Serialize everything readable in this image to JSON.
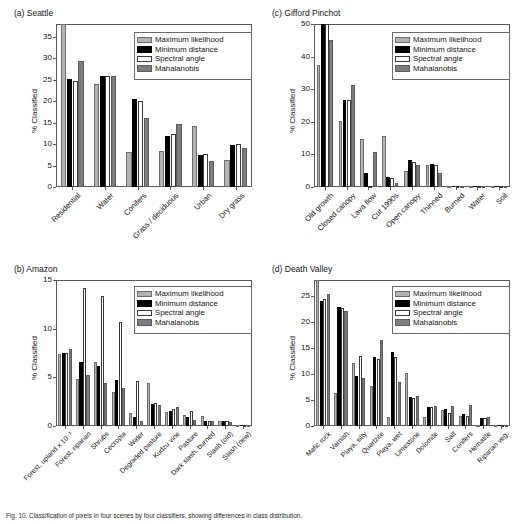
{
  "figure": {
    "caption": "Fig. 10. Classification of pixels in four scenes by four classifiers, showing differences in class distribution."
  },
  "legend": {
    "entries": [
      {
        "label": "Maximum likelihood",
        "key": "ml",
        "color": "#b3b3b3"
      },
      {
        "label": "Minimum distance",
        "key": "md",
        "color": "#000000"
      },
      {
        "label": "Spectral angle",
        "key": "sa",
        "color": "#ffffff"
      },
      {
        "label": "Mahalanobis",
        "key": "mh",
        "color": "#7d7d7d"
      }
    ]
  },
  "chart_data": [
    {
      "type": "bar",
      "panel": "a",
      "title": "(a) Seattle",
      "ylabel": "% Classified",
      "xlabel": "",
      "ylim": [
        0,
        38
      ],
      "yticks": [
        0,
        5,
        10,
        15,
        20,
        25,
        30,
        35
      ],
      "grid": false,
      "legend_position": "top-right",
      "categories": [
        "Residential",
        "Water",
        "Conifers",
        "Grass / deciduous",
        "Urban",
        "Dry grass"
      ],
      "series": [
        {
          "name": "Maximum likelihood",
          "values": [
            38.0,
            24.0,
            8.1,
            8.5,
            14.2,
            6.2
          ]
        },
        {
          "name": "Minimum distance",
          "values": [
            25.1,
            25.9,
            20.5,
            12.0,
            7.5,
            9.7
          ]
        },
        {
          "name": "Spectral angle",
          "values": [
            24.7,
            25.9,
            20.1,
            12.3,
            7.6,
            10.1
          ]
        },
        {
          "name": "Mahalanobis",
          "values": [
            29.3,
            25.8,
            16.0,
            14.7,
            6.0,
            9.0
          ]
        }
      ]
    },
    {
      "type": "bar",
      "panel": "b",
      "title": "(b) Amazon",
      "ylabel": "% Classified",
      "xlabel": "",
      "ylim": [
        0,
        15
      ],
      "yticks": [
        0,
        5,
        10,
        15
      ],
      "grid": false,
      "legend_position": "top-right",
      "categories": [
        "Forest, upland x 10⁻¹",
        "Forest, riparian",
        "Shrubs",
        "Cecropia",
        "Water",
        "Degraded pasture",
        "Kudzu vine",
        "Pasture",
        "Dark slash, burned",
        "Slash (old)",
        "Slash (new)"
      ],
      "series": [
        {
          "name": "Maximum likelihood",
          "values": [
            7.4,
            4.8,
            6.6,
            3.5,
            1.3,
            4.4,
            1.4,
            1.1,
            1.0,
            0.5,
            0.1
          ]
        },
        {
          "name": "Minimum distance",
          "values": [
            7.5,
            6.6,
            6.2,
            4.7,
            0.9,
            2.3,
            1.5,
            0.9,
            0.5,
            0.5,
            0.1
          ]
        },
        {
          "name": "Spectral angle",
          "values": [
            7.5,
            14.2,
            13.4,
            10.7,
            4.6,
            2.4,
            1.7,
            1.5,
            0.5,
            0.5,
            0.1
          ]
        },
        {
          "name": "Mahalanobis",
          "values": [
            7.9,
            5.2,
            4.4,
            3.9,
            0.5,
            2.2,
            2.0,
            0.6,
            0.5,
            0.4,
            0.1
          ]
        }
      ]
    },
    {
      "type": "bar",
      "panel": "c",
      "title": "(c) Gifford Pinchot",
      "ylabel": "% Classified",
      "xlabel": "",
      "ylim": [
        0,
        50
      ],
      "yticks": [
        0,
        10,
        20,
        30,
        40,
        50
      ],
      "grid": false,
      "legend_position": "top-right",
      "categories": [
        "Old growth",
        "Closed canopy",
        "Lava flow",
        "Cut 1990s",
        "Open canopy",
        "Thinned",
        "Burned",
        "Water",
        "Soil"
      ],
      "series": [
        {
          "name": "Maximum likelihood",
          "values": [
            37.5,
            20.3,
            14.6,
            15.5,
            5.0,
            6.8,
            0.2,
            0.1,
            0.1
          ]
        },
        {
          "name": "Minimum distance",
          "values": [
            50.0,
            26.8,
            4.3,
            3.0,
            8.2,
            7.0,
            0.1,
            0.1,
            0.1
          ]
        },
        {
          "name": "Spectral angle",
          "values": [
            50.0,
            26.6,
            0.1,
            2.9,
            7.6,
            6.8,
            0.1,
            0.1,
            0.1
          ]
        },
        {
          "name": "Mahalanobis",
          "values": [
            45.1,
            31.2,
            10.8,
            1.2,
            6.9,
            4.3,
            0.3,
            0.1,
            0.2
          ]
        }
      ]
    },
    {
      "type": "bar",
      "panel": "d",
      "title": "(d) Death Valley",
      "ylabel": "% Classified",
      "xlabel": "",
      "ylim": [
        0,
        28
      ],
      "yticks": [
        0,
        5,
        10,
        15,
        20,
        25
      ],
      "grid": false,
      "legend_position": "top-right",
      "categories": [
        "Mafic rock",
        "Varnish",
        "Playa, silty",
        "Quartzite",
        "Playa, wet",
        "Limestone",
        "Dolomite",
        "Salt",
        "Conifers",
        "Hematite",
        "Riparian veg."
      ],
      "series": [
        {
          "name": "Maximum likelihood",
          "values": [
            28.0,
            6.4,
            12.0,
            7.6,
            1.7,
            10.1,
            1.7,
            3.1,
            2.0,
            0.2,
            0.1
          ]
        },
        {
          "name": "Minimum distance",
          "values": [
            23.9,
            22.8,
            9.5,
            13.3,
            14.1,
            5.5,
            3.6,
            3.3,
            2.3,
            1.6,
            0.1
          ]
        },
        {
          "name": "Spectral angle",
          "values": [
            24.3,
            22.6,
            13.4,
            12.9,
            13.3,
            5.3,
            3.7,
            2.4,
            1.9,
            1.6,
            0.1
          ]
        },
        {
          "name": "Mahalanobis",
          "values": [
            25.4,
            22.0,
            9.2,
            16.5,
            8.5,
            5.8,
            3.8,
            3.9,
            4.0,
            1.8,
            0.1
          ]
        }
      ]
    }
  ]
}
